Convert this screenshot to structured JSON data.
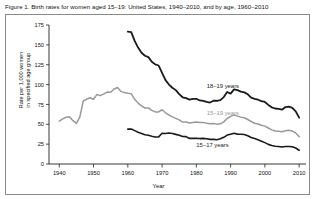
{
  "figure": {
    "title": "Figure 1. Birth rates for women aged 15–19: United States, 1940–2010, and by age, 1960–2010"
  },
  "axes": {
    "xlabel": "Year",
    "ylabel_line1": "Rate per 1,000 women",
    "ylabel_line2": "in specified age group",
    "xticks": [
      "1940",
      "1950",
      "1960",
      "1970",
      "1980",
      "1990",
      "2000",
      "2010"
    ],
    "yticks": [
      "0",
      "25",
      "50",
      "75",
      "100",
      "125",
      "150",
      "175"
    ]
  },
  "colors": {
    "series_dark": "#1a1a1a",
    "series_gray": "#999999",
    "axis": "#222222",
    "frame": "#8a8a8a",
    "background": "#ffffff"
  },
  "series_labels": {
    "age_18_19": "18–19 years",
    "age_15_19": "15–19 years",
    "age_15_17": "15–17 years"
  },
  "chart_data": {
    "type": "line",
    "title": "Figure 1. Birth rates for women aged 15–19: United States, 1940–2010, and by age, 1960–2010",
    "xlabel": "Year",
    "ylabel": "Rate per 1,000 women in specified age group",
    "xlim": [
      1937,
      2012
    ],
    "ylim": [
      0,
      175
    ],
    "xticks": [
      1940,
      1950,
      1960,
      1970,
      1980,
      1990,
      2000,
      2010
    ],
    "yticks": [
      0,
      25,
      50,
      75,
      100,
      125,
      150,
      175
    ],
    "grid": false,
    "legend": "inline-annotations",
    "series": [
      {
        "name": "15–19 years",
        "color": "#999999",
        "linewidth": 1.5,
        "x": [
          1940,
          1941,
          1942,
          1943,
          1944,
          1945,
          1946,
          1947,
          1948,
          1949,
          1950,
          1951,
          1952,
          1953,
          1954,
          1955,
          1956,
          1957,
          1958,
          1959,
          1960,
          1961,
          1962,
          1963,
          1964,
          1965,
          1966,
          1967,
          1968,
          1969,
          1970,
          1971,
          1972,
          1973,
          1974,
          1975,
          1976,
          1977,
          1978,
          1979,
          1980,
          1981,
          1982,
          1983,
          1984,
          1985,
          1986,
          1987,
          1988,
          1989,
          1990,
          1991,
          1992,
          1993,
          1994,
          1995,
          1996,
          1997,
          1998,
          1999,
          2000,
          2001,
          2002,
          2003,
          2004,
          2005,
          2006,
          2007,
          2008,
          2009,
          2010
        ],
        "y": [
          54.1,
          56.9,
          58.9,
          59.4,
          54.5,
          51.1,
          59.3,
          79.3,
          81.8,
          83.4,
          81.6,
          87.6,
          86.1,
          88.2,
          90.6,
          90.3,
          94.5,
          96.3,
          91.4,
          89.9,
          89.1,
          88.6,
          81.4,
          76.7,
          73.1,
          70.5,
          70.6,
          67.5,
          65.6,
          65.5,
          68.3,
          64.5,
          61.7,
          59.3,
          57.5,
          55.6,
          52.8,
          52.8,
          51.5,
          52.3,
          53.0,
          52.2,
          52.4,
          51.4,
          50.6,
          51.0,
          50.2,
          50.6,
          53.0,
          57.3,
          59.9,
          61.8,
          60.3,
          59.0,
          58.2,
          56.0,
          53.5,
          51.3,
          50.3,
          48.8,
          47.7,
          45.3,
          43.0,
          41.6,
          41.1,
          40.5,
          41.9,
          42.5,
          41.5,
          39.1,
          34.2
        ]
      },
      {
        "name": "18–19 years",
        "color": "#1a1a1a",
        "linewidth": 1.8,
        "x": [
          1960,
          1961,
          1962,
          1963,
          1964,
          1965,
          1966,
          1967,
          1968,
          1969,
          1970,
          1971,
          1972,
          1973,
          1974,
          1975,
          1976,
          1977,
          1978,
          1979,
          1980,
          1981,
          1982,
          1983,
          1984,
          1985,
          1986,
          1987,
          1988,
          1989,
          1990,
          1991,
          1992,
          1993,
          1994,
          1995,
          1996,
          1997,
          1998,
          1999,
          2000,
          2001,
          2002,
          2003,
          2004,
          2005,
          2006,
          2007,
          2008,
          2009,
          2010
        ],
        "y": [
          166.7,
          166.0,
          155.0,
          146.6,
          140.0,
          136.3,
          134.6,
          128.8,
          125.4,
          124.0,
          114.7,
          105.6,
          100.0,
          96.0,
          93.0,
          88.0,
          84.0,
          83.0,
          81.0,
          82.0,
          82.1,
          80.0,
          79.4,
          78.1,
          77.4,
          79.6,
          79.6,
          80.4,
          84.2,
          90.7,
          88.6,
          94.0,
          93.0,
          91.1,
          90.2,
          87.7,
          83.6,
          82.1,
          80.9,
          79.1,
          78.1,
          74.4,
          71.4,
          69.9,
          69.5,
          68.4,
          71.7,
          72.2,
          70.6,
          66.2,
          58.3
        ]
      },
      {
        "name": "15–17 years",
        "color": "#1a1a1a",
        "linewidth": 1.6,
        "x": [
          1960,
          1961,
          1962,
          1963,
          1964,
          1965,
          1966,
          1967,
          1968,
          1969,
          1970,
          1971,
          1972,
          1973,
          1974,
          1975,
          1976,
          1977,
          1978,
          1979,
          1980,
          1981,
          1982,
          1983,
          1984,
          1985,
          1986,
          1987,
          1988,
          1989,
          1990,
          1991,
          1992,
          1993,
          1994,
          1995,
          1996,
          1997,
          1998,
          1999,
          2000,
          2001,
          2002,
          2003,
          2004,
          2005,
          2006,
          2007,
          2008,
          2009,
          2010
        ],
        "y": [
          43.9,
          44.0,
          42.0,
          40.0,
          38.5,
          36.9,
          36.2,
          35.0,
          34.0,
          34.2,
          38.8,
          38.3,
          39.0,
          38.5,
          37.3,
          36.1,
          34.6,
          34.5,
          32.2,
          32.3,
          32.5,
          32.0,
          32.3,
          31.8,
          31.0,
          31.0,
          30.5,
          31.7,
          33.6,
          36.4,
          37.5,
          38.6,
          37.6,
          37.5,
          37.2,
          35.5,
          33.3,
          32.0,
          30.4,
          28.7,
          26.9,
          24.7,
          23.2,
          22.4,
          22.1,
          21.4,
          22.0,
          22.1,
          21.7,
          20.1,
          17.3
        ]
      }
    ],
    "annotations": [
      {
        "text": "18–19 years",
        "x": 1983,
        "y": 96,
        "color": "#1a1a1a"
      },
      {
        "text": "15–19 years",
        "x": 1983,
        "y": 62,
        "color": "#999999"
      },
      {
        "text": "15–17 years",
        "x": 1980,
        "y": 22,
        "color": "#1a1a1a"
      }
    ]
  }
}
